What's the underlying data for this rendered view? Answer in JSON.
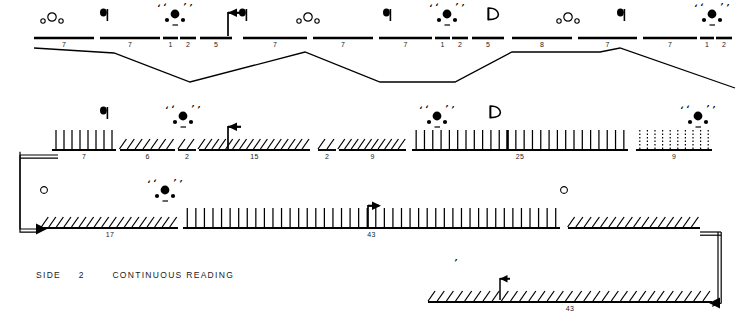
{
  "caption": {
    "side_label": "SIDE",
    "side_number": "2",
    "mode_label": "CONTINUOUS READING"
  },
  "colors": {
    "ink": "#000000",
    "paper": "#ffffff",
    "text": "#1a1a1a"
  },
  "legend_glyphs": {
    "q_up": "q-flag-glyph",
    "d_up": "d-flag-glyph",
    "arrow_left": "left-arrow-flag-icon",
    "arrow_right": "right-arrow-flag-icon",
    "open_circles": "open-circle-cluster-icon",
    "filled_dots": "filled-dot-cluster-icon"
  },
  "staves": [
    {
      "name": "staff-row-1",
      "style": "plain",
      "y": 38,
      "segments": [
        {
          "label": "7",
          "x1": 34,
          "x2": 94,
          "style": "plain"
        },
        {
          "label": "7",
          "x1": 100,
          "x2": 160,
          "style": "plain"
        },
        {
          "label": "1",
          "x1": 163,
          "x2": 178,
          "style": "plain"
        },
        {
          "label": "2",
          "x1": 180,
          "x2": 196,
          "style": "plain"
        },
        {
          "label": "5",
          "x1": 200,
          "x2": 232,
          "style": "plain"
        },
        {
          "label": "7",
          "x1": 243,
          "x2": 307,
          "style": "plain"
        },
        {
          "label": "7",
          "x1": 313,
          "x2": 373,
          "style": "plain"
        },
        {
          "label": "7",
          "x1": 379,
          "x2": 432,
          "style": "plain"
        },
        {
          "label": "1",
          "x1": 435,
          "x2": 450,
          "style": "plain"
        },
        {
          "label": "2",
          "x1": 452,
          "x2": 468,
          "style": "plain"
        },
        {
          "label": "5",
          "x1": 472,
          "x2": 504,
          "style": "plain"
        },
        {
          "label": "8",
          "x1": 512,
          "x2": 572,
          "style": "plain"
        },
        {
          "label": "7",
          "x1": 578,
          "x2": 637,
          "style": "plain"
        },
        {
          "label": "7",
          "x1": 643,
          "x2": 697,
          "style": "plain"
        },
        {
          "label": "1",
          "x1": 700,
          "x2": 714,
          "style": "plain"
        },
        {
          "label": "2",
          "x1": 716,
          "x2": 732,
          "style": "plain"
        }
      ],
      "markers": [
        {
          "type": "open-circle-cluster",
          "x": 52,
          "y": 18
        },
        {
          "type": "q-flag",
          "x": 104,
          "y": 18
        },
        {
          "type": "dot-cluster",
          "x": 175,
          "y": 14
        },
        {
          "type": "arrow-left-flag",
          "x": 228,
          "y": 12
        },
        {
          "type": "q-flag",
          "x": 243,
          "y": 18
        },
        {
          "type": "open-circle-cluster",
          "x": 308,
          "y": 18
        },
        {
          "type": "q-flag",
          "x": 387,
          "y": 18
        },
        {
          "type": "dot-cluster",
          "x": 447,
          "y": 14
        },
        {
          "type": "d-flag",
          "x": 492,
          "y": 18
        },
        {
          "type": "open-circle-cluster",
          "x": 568,
          "y": 18
        },
        {
          "type": "q-flag",
          "x": 621,
          "y": 18
        },
        {
          "type": "dot-cluster",
          "x": 712,
          "y": 14
        }
      ]
    },
    {
      "name": "staff-row-2",
      "style": "hatched",
      "y": 150,
      "segments": [
        {
          "label": "7",
          "x1": 52,
          "x2": 116,
          "style": "vertical",
          "ticks": 8
        },
        {
          "label": "6",
          "x1": 120,
          "x2": 175,
          "style": "slant",
          "ticks": 7
        },
        {
          "label": "2",
          "x1": 178,
          "x2": 196,
          "style": "slant",
          "ticks": 2
        },
        {
          "label": "15",
          "x1": 199,
          "x2": 310,
          "style": "slant",
          "ticks": 16
        },
        {
          "label": "2",
          "x1": 318,
          "x2": 336,
          "style": "slant",
          "ticks": 2
        },
        {
          "label": "9",
          "x1": 339,
          "x2": 406,
          "style": "slant",
          "ticks": 10
        },
        {
          "label": "25",
          "x1": 412,
          "x2": 628,
          "style": "vertical",
          "ticks": 26
        },
        {
          "label": "9",
          "x1": 636,
          "x2": 712,
          "style": "dotted",
          "ticks": 10
        }
      ],
      "markers": [
        {
          "type": "q-flag",
          "x": 104,
          "y": 116
        },
        {
          "type": "dot-cluster",
          "x": 183,
          "y": 116
        },
        {
          "type": "arrow-left-flag",
          "x": 228,
          "y": 126
        },
        {
          "type": "dot-cluster",
          "x": 437,
          "y": 116
        },
        {
          "type": "d-flag",
          "x": 494,
          "y": 116
        },
        {
          "type": "dot-cluster",
          "x": 698,
          "y": 116
        }
      ]
    },
    {
      "name": "staff-row-3",
      "style": "hatched",
      "y": 228,
      "segments": [
        {
          "label": "17",
          "x1": 42,
          "x2": 178,
          "style": "slant",
          "ticks": 18
        },
        {
          "label": "43",
          "x1": 183,
          "x2": 560,
          "style": "vertical",
          "ticks": 44
        },
        {
          "label": "",
          "x1": 568,
          "x2": 700,
          "style": "slant",
          "ticks": 16
        }
      ],
      "markers": [
        {
          "type": "hollow-circle",
          "x": 44,
          "y": 190
        },
        {
          "type": "dot-cluster",
          "x": 165,
          "y": 190
        },
        {
          "type": "arrow-right-flag",
          "x": 368,
          "y": 205
        },
        {
          "type": "hollow-circle",
          "x": 564,
          "y": 190
        }
      ]
    },
    {
      "name": "staff-row-4",
      "style": "hatched",
      "y": 302,
      "segments": [
        {
          "label": "43",
          "x1": 428,
          "x2": 712,
          "style": "slant",
          "ticks": 31
        }
      ],
      "markers": [
        {
          "type": "small-comma",
          "x": 456,
          "y": 266
        },
        {
          "type": "arrow-left-flag-small",
          "x": 500,
          "y": 278
        }
      ]
    }
  ],
  "connectors": [
    {
      "name": "zigzag-connector",
      "points": "34,48 114,53 190,82 305,52 380,82 455,82 512,52 600,52 620,48 735,88"
    },
    {
      "name": "left-wrap-bracket",
      "from": "staff-row-2-start",
      "to": "staff-row-3-start"
    },
    {
      "name": "right-wrap-bracket",
      "from": "staff-row-3-end",
      "to": "staff-row-4-end"
    }
  ]
}
